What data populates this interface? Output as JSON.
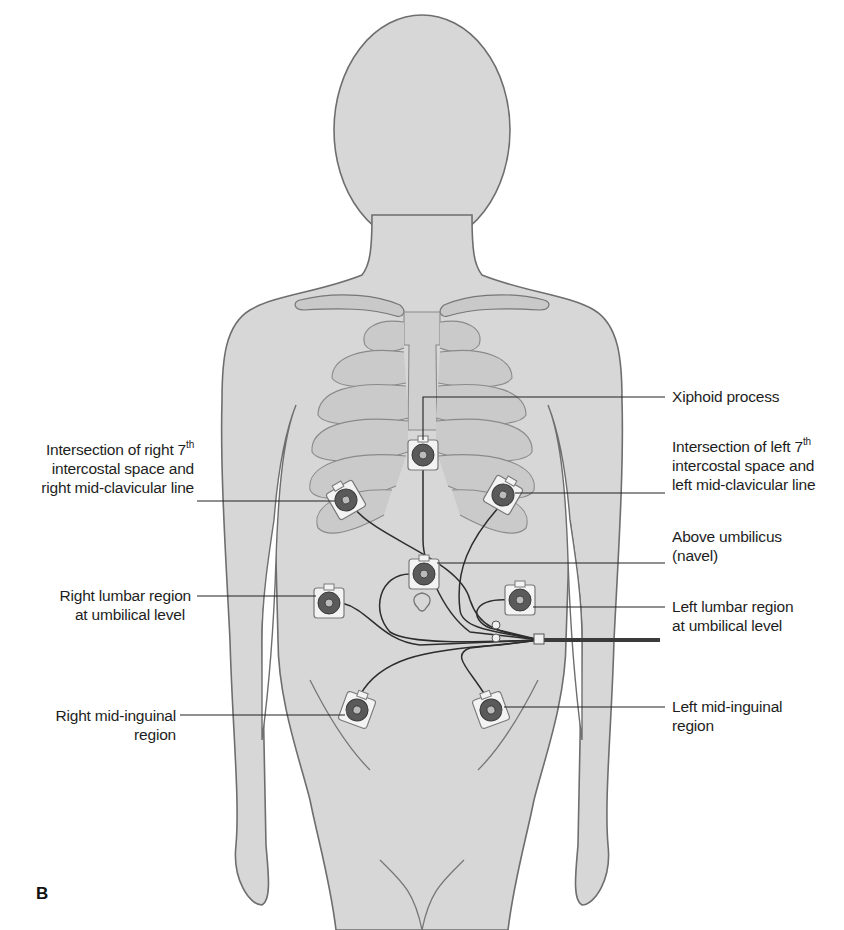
{
  "figure": {
    "panel_letter": "B",
    "colors": {
      "skin": "#d6d6d6",
      "outline": "#6e6e6e",
      "bone": "#c4c4c4",
      "electrode_pad": "#f2f2f2",
      "electrode_disc": "#555555",
      "lead_wire": "#2a2a2a"
    }
  },
  "labels": {
    "xiphoid": {
      "text": "Xiphoid process"
    },
    "right_7th": {
      "line1_pre": "Intersection of right 7",
      "line1_sup": "th",
      "line2": "intercostal space and",
      "line3": "right mid-clavicular line"
    },
    "left_7th": {
      "line1_pre": "Intersection of left 7",
      "line1_sup": "th",
      "line2": "intercostal space and",
      "line3": "left mid-clavicular line"
    },
    "above_umbilicus": {
      "line1": "Above umbilicus",
      "line2": "(navel)"
    },
    "right_lumbar": {
      "line1": "Right lumbar region",
      "line2": "at umbilical level"
    },
    "left_lumbar": {
      "line1": "Left lumbar region",
      "line2": "at umbilical level"
    },
    "right_inguinal": {
      "line1": "Right mid-inguinal",
      "line2": "region"
    },
    "left_inguinal": {
      "line1": "Left mid-inguinal",
      "line2": "region"
    }
  },
  "electrodes": [
    {
      "id": "xiphoid",
      "x": 423,
      "y": 455
    },
    {
      "id": "right_7th_ics",
      "x": 346,
      "y": 500
    },
    {
      "id": "left_7th_ics",
      "x": 503,
      "y": 495
    },
    {
      "id": "above_umbilicus",
      "x": 424,
      "y": 574
    },
    {
      "id": "right_lumbar",
      "x": 329,
      "y": 603
    },
    {
      "id": "left_lumbar",
      "x": 520,
      "y": 600
    },
    {
      "id": "right_mid_inguinal",
      "x": 357,
      "y": 710
    },
    {
      "id": "left_mid_inguinal",
      "x": 491,
      "y": 710
    }
  ]
}
